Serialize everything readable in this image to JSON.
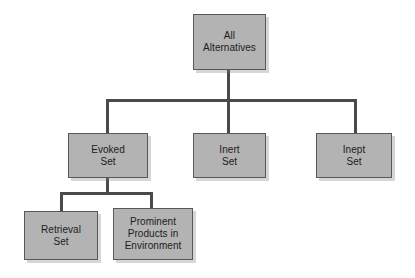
{
  "diagram": {
    "background_color": "#ffffff",
    "box_fill_color": "#b3b3b3",
    "box_border_color": "#585858",
    "connector_color": "#4a4a4a",
    "text_color": "#1c1c1c",
    "nodes": [
      {
        "id": "all-alternatives",
        "label": "All\nAlternatives",
        "level": 1
      },
      {
        "id": "evoked-set",
        "label": "Evoked\nSet",
        "level": 2
      },
      {
        "id": "inert-set",
        "label": "Inert\nSet",
        "level": 2
      },
      {
        "id": "inept-set",
        "label": "Inept\nSet",
        "level": 2
      },
      {
        "id": "retrieval-set",
        "label": "Retrieval\nSet",
        "level": 3
      },
      {
        "id": "prominent-products",
        "label": "Prominent\nProducts in\nEnvironment",
        "level": 3
      }
    ],
    "edges": [
      {
        "from": "all-alternatives",
        "to": "evoked-set"
      },
      {
        "from": "all-alternatives",
        "to": "inert-set"
      },
      {
        "from": "all-alternatives",
        "to": "inept-set"
      },
      {
        "from": "evoked-set",
        "to": "retrieval-set"
      },
      {
        "from": "evoked-set",
        "to": "prominent-products"
      }
    ]
  }
}
